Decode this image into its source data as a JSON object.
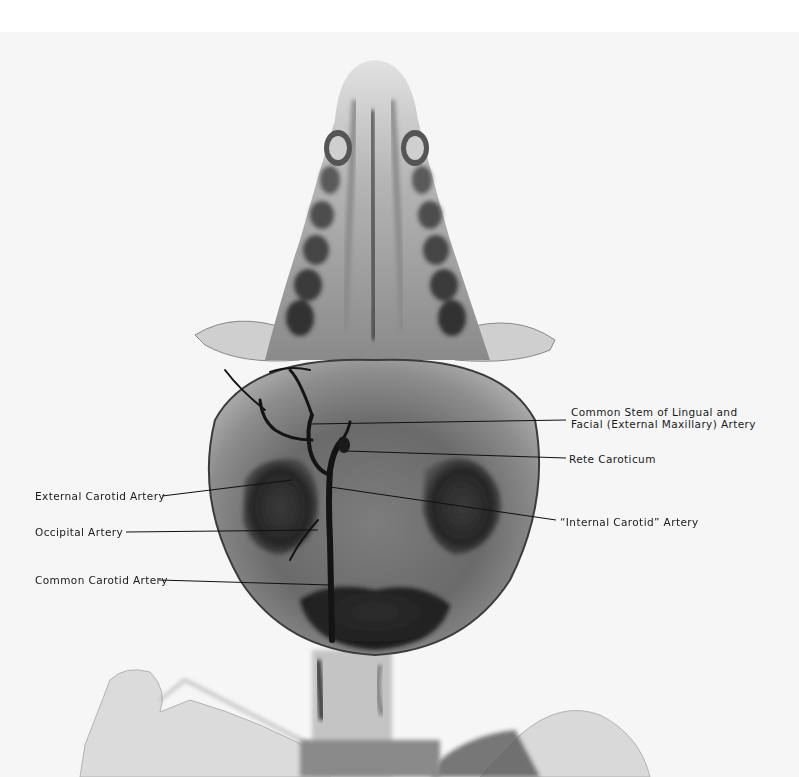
{
  "figure": {
    "type": "radiograph",
    "colors": {
      "background": "#ffffff",
      "plate": "#f6f6f6",
      "vessel": "#141414",
      "bone": "#6e6e6e"
    }
  },
  "labels": {
    "common_stem": {
      "line1": "Common Stem of Lingual and",
      "line2": "Facial (External Maxillary) Artery"
    },
    "rete_caroticum": "Rete Caroticum",
    "external_carotid": "External Carotid Artery",
    "internal_carotid": "“Internal Carotid” Artery",
    "occipital": "Occipital Artery",
    "common_carotid": "Common Carotid Artery"
  }
}
